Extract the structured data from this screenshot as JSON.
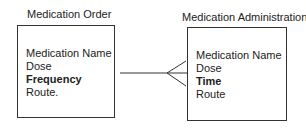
{
  "entities": [
    {
      "title": "Medication Order",
      "attributes": [
        "Medication Name",
        "Dose",
        "Frequency",
        "Route."
      ],
      "bold_attribute_index": 2
    },
    {
      "title": "Medication Administration",
      "attributes": [
        "Medication Name",
        "Dose",
        "Time",
        "Route"
      ],
      "bold_attribute_index": 2
    }
  ],
  "relationship": {
    "type": "one-to-many",
    "from": "Medication Order",
    "to": "Medication Administration"
  }
}
